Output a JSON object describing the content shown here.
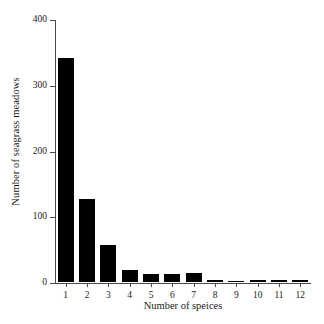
{
  "chart_data": {
    "type": "bar",
    "title": "",
    "xlabel": "Number of speices",
    "ylabel": "Number of seagrass meadows",
    "categories": [
      "1",
      "2",
      "3",
      "4",
      "5",
      "6",
      "7",
      "8",
      "9",
      "10",
      "11",
      "12"
    ],
    "values": [
      341,
      126,
      56,
      18,
      12,
      12,
      13,
      3,
      1,
      3,
      3,
      3
    ],
    "ylim": [
      0,
      400
    ],
    "yticks": [
      0,
      100,
      200,
      300,
      400
    ],
    "ytick_labels": [
      "0",
      "100",
      "200",
      "300",
      "400"
    ],
    "xtick_labels": [
      "1",
      "2",
      "3",
      "4",
      "5",
      "6",
      "7",
      "8",
      "9",
      "10",
      "11",
      "12"
    ],
    "grid": false,
    "legend": false,
    "bar_color": "#000000",
    "axis_color": "#4a4a4a",
    "background": "#ffffff"
  }
}
